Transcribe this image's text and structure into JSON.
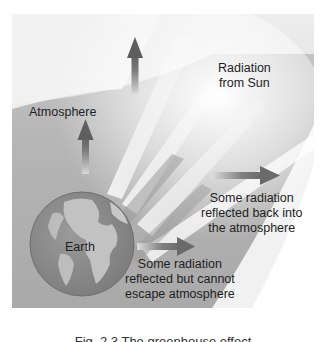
{
  "diagram": {
    "title": "Greenhouse effect",
    "labels": {
      "radiation_from_sun": [
        "Radiation",
        "from Sun"
      ],
      "atmosphere": "Atmosphere",
      "earth": "Earth",
      "reflected_back": [
        "Some radiation",
        "reflected back into",
        "the atmosphere"
      ],
      "reflected_trapped": [
        "Some radiation",
        "reflected but cannot",
        "escape atmosphere"
      ]
    },
    "caption": "Fig. 2.3 The greenhouse effect",
    "colors": {
      "background_dark": "#a9a9a9",
      "background_light": "#f2f2f2",
      "arrow": "#707070",
      "earth_ocean": "#8a8a8a",
      "earth_land": "#bdbdbd",
      "text": "#1e1e1e"
    }
  }
}
